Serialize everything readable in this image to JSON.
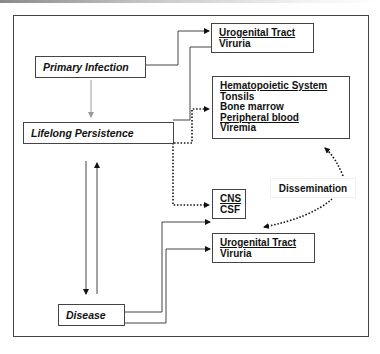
{
  "diagram": {
    "nodes": {
      "primary_infection": {
        "label": "Primary Infection"
      },
      "lifelong_persistence": {
        "label": "Lifelong Persistence"
      },
      "disease": {
        "label": "Disease"
      },
      "urogenital_top": {
        "title": "Urogenital Tract",
        "items": [
          "Viruria"
        ]
      },
      "hematopoietic": {
        "title": "Hematopoietic System",
        "items": [
          "Tonsils",
          "Bone marrow",
          "Peripheral blood",
          "Viremia"
        ]
      },
      "cns": {
        "title": "CNS",
        "items": [
          "CSF"
        ]
      },
      "urogenital_bottom": {
        "title": "Urogenital Tract",
        "items": [
          "Viruria"
        ]
      }
    },
    "dissemination_label": "Dissemination",
    "edges": [
      {
        "from": "Primary Infection",
        "to": "Lifelong Persistence",
        "style": "gray-arrow"
      },
      {
        "from": "Primary Infection",
        "to": "Urogenital Tract (top)",
        "style": "solid"
      },
      {
        "from": "Lifelong Persistence",
        "to": "Urogenital Tract (top)",
        "style": "solid"
      },
      {
        "from": "Lifelong Persistence",
        "to": "Hematopoietic System",
        "style": "dotted"
      },
      {
        "from": "Lifelong Persistence",
        "to": "CNS",
        "style": "dotted"
      },
      {
        "from": "Lifelong Persistence",
        "to": "Disease",
        "style": "solid"
      },
      {
        "from": "Disease",
        "to": "Lifelong Persistence",
        "style": "solid"
      },
      {
        "from": "Disease",
        "to": "CNS",
        "style": "solid"
      },
      {
        "from": "Disease",
        "to": "Urogenital Tract (bottom)",
        "style": "solid"
      },
      {
        "from": "Dissemination",
        "to": "Hematopoietic System",
        "style": "dotted"
      },
      {
        "from": "Dissemination",
        "to": "Urogenital Tract (bottom)",
        "style": "dotted"
      }
    ],
    "colors": {
      "line": "#444444",
      "gray_arrow": "#9a9a9a",
      "text": "#111111"
    }
  }
}
